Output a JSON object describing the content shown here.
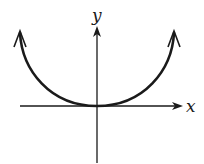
{
  "figure": {
    "x_axis_label": "x",
    "y_axis_label": "y",
    "colors": {
      "curve": "#1a1a1a",
      "axes": "#1a1a1a",
      "background": "#ffffff"
    }
  }
}
